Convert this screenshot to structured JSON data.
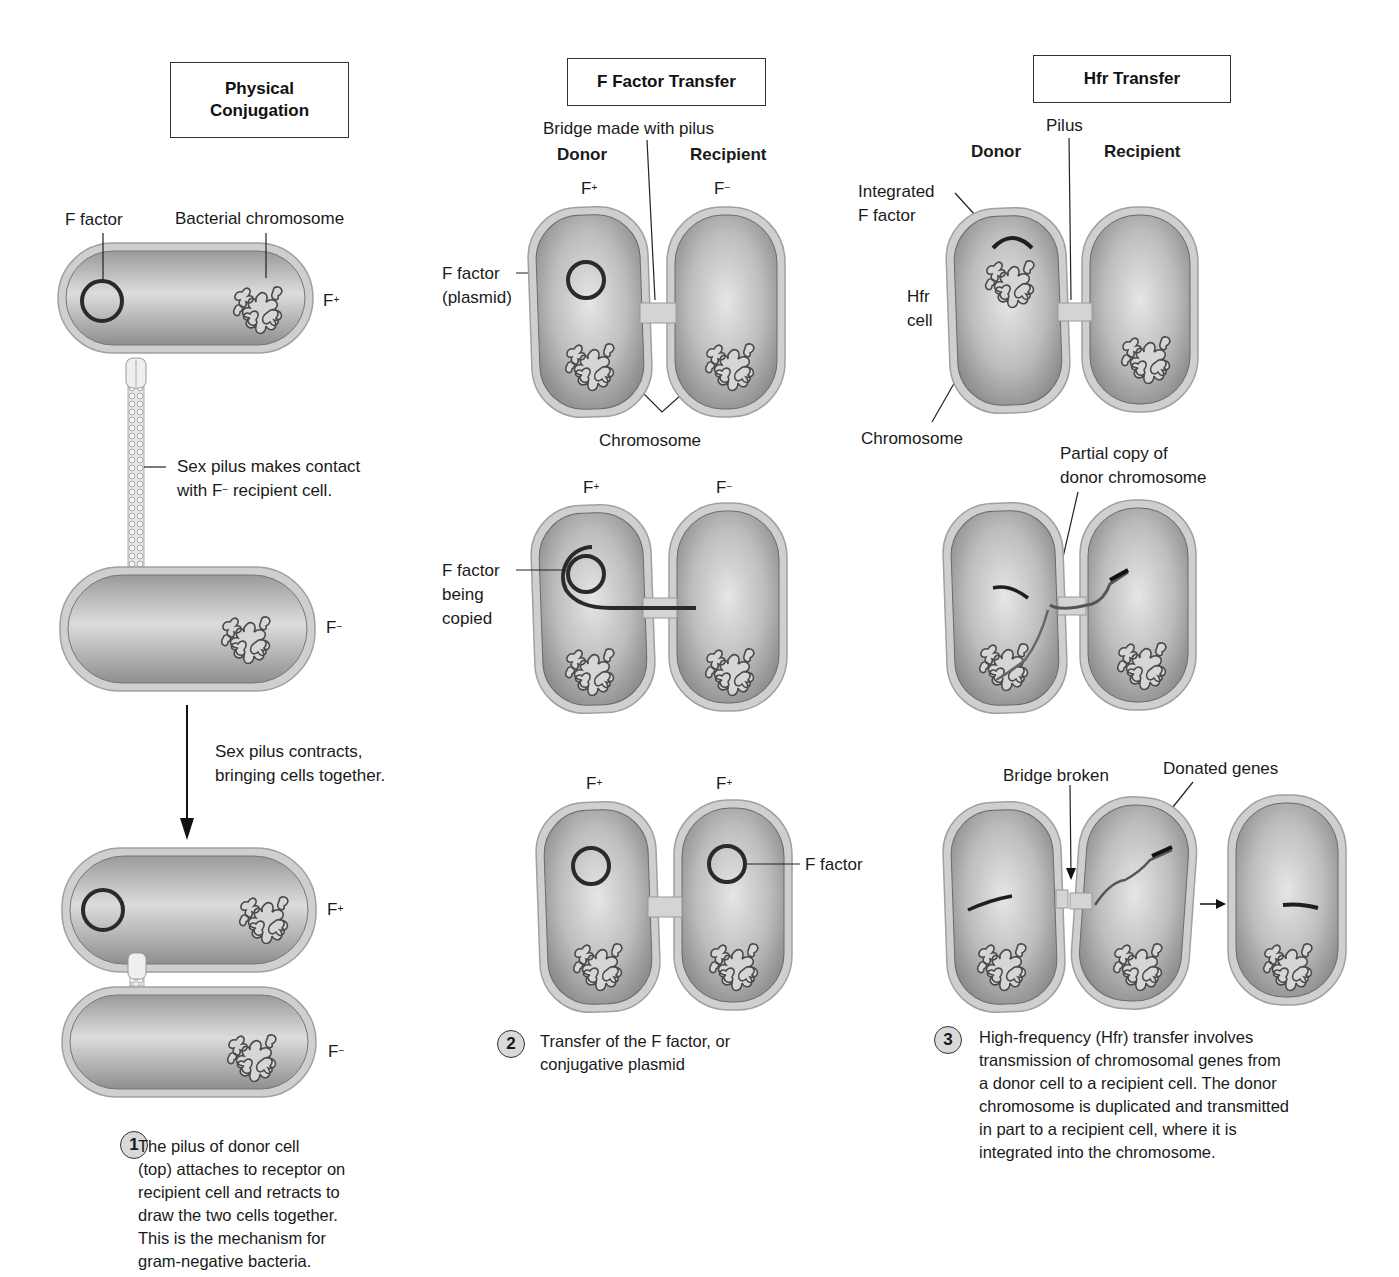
{
  "panels": {
    "physical": {
      "title_line1": "Physical",
      "title_line2": "Conjugation",
      "labels": {
        "f_factor": "F factor",
        "bacterial_chromosome": "Bacterial chromosome",
        "f_plus_top": "F",
        "f_plus_top_sup": "+",
        "pilus_contact_line1": "Sex pilus makes contact",
        "pilus_contact_line2_pre": "with F",
        "pilus_contact_line2_sup": "−",
        "pilus_contact_line2_post": " recipient cell.",
        "f_minus_mid": "F",
        "f_minus_mid_sup": "−",
        "contracts_line1": "Sex pilus contracts,",
        "contracts_line2": "bringing cells together.",
        "f_plus_bottom": "F",
        "f_plus_bottom_sup": "+",
        "f_minus_bottom": "F",
        "f_minus_bottom_sup": "−"
      },
      "step": {
        "number": "1",
        "lines": [
          "The pilus of donor cell",
          "(top) attaches to receptor on",
          "recipient cell and retracts to",
          "draw the two cells together.",
          "This is the mechanism for",
          "gram-negative bacteria."
        ]
      }
    },
    "f_factor_transfer": {
      "title": "F Factor Transfer",
      "labels": {
        "bridge": "Bridge made with pilus",
        "donor": "Donor",
        "recipient": "Recipient",
        "stage1_left": "F",
        "stage1_left_sup": "+",
        "stage1_right": "F",
        "stage1_right_sup": "−",
        "f_factor_plasmid_line1": "F factor",
        "f_factor_plasmid_line2": "(plasmid)",
        "chromosome": "Chromosome",
        "stage2_left": "F",
        "stage2_left_sup": "+",
        "stage2_right": "F",
        "stage2_right_sup": "−",
        "copied_line1": "F factor",
        "copied_line2": "being",
        "copied_line3": "copied",
        "stage3_left": "F",
        "stage3_left_sup": "+",
        "stage3_right": "F",
        "stage3_right_sup": "+",
        "f_factor": "F factor"
      },
      "step": {
        "number": "2",
        "lines": [
          "Transfer of the F factor, or",
          "conjugative plasmid"
        ]
      }
    },
    "hfr_transfer": {
      "title": "Hfr Transfer",
      "labels": {
        "pilus": "Pilus",
        "donor": "Donor",
        "recipient": "Recipient",
        "integrated_line1": "Integrated",
        "integrated_line2": "F factor",
        "hfr_line1": "Hfr",
        "hfr_line2": "cell",
        "chromosome": "Chromosome",
        "partial_line1": "Partial copy of",
        "partial_line2": "donor chromosome",
        "bridge_broken": "Bridge broken",
        "donated_genes": "Donated genes"
      },
      "step": {
        "number": "3",
        "lines": [
          "High-frequency (Hfr) transfer involves",
          "transmission of chromosomal genes from",
          "a donor cell to a recipient cell. The donor",
          "chromosome is duplicated and transmitted",
          "in part to a recipient cell, where it is",
          "integrated into the chromosome."
        ]
      }
    }
  },
  "colors": {
    "cell_wall": "#c9c9c9",
    "cell_fill": "#a8a8a8",
    "plasmid": "#2a2a2a",
    "step_badge": "#d9d9d9"
  }
}
